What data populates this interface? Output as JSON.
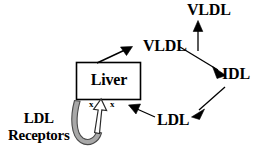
{
  "diagram": {
    "background_color": "#ffffff",
    "stroke_color": "#000000",
    "receptor_fill_color": "#a8a8a8",
    "arrow_hollow_fill_color": "#ffffff",
    "nodes": [
      {
        "id": "vldl-plasma",
        "label": "VLDL"
      },
      {
        "id": "vldl-hepatic",
        "label": "VLDL"
      },
      {
        "id": "idl",
        "label": "IDL"
      },
      {
        "id": "ldl",
        "label": "LDL"
      },
      {
        "id": "liver",
        "label": "Liver"
      }
    ],
    "receptors": {
      "label_line_1": "LDL",
      "label_line_2": "Receptors"
    },
    "markers": {
      "left": "x",
      "right": "x"
    },
    "edges": [
      {
        "id": "liver-to-vldl",
        "from": "liver",
        "to": "vldl-hepatic",
        "style": "solid-filled-arrow"
      },
      {
        "id": "vldl-to-plasma",
        "from": "vldl-hepatic",
        "to": "vldl-plasma",
        "style": "solid-filled-arrow"
      },
      {
        "id": "vldl-to-idl",
        "from": "vldl-hepatic",
        "to": "idl",
        "style": "solid-filled-arrow"
      },
      {
        "id": "idl-to-ldl",
        "from": "idl",
        "to": "ldl",
        "style": "solid-filled-arrow"
      },
      {
        "id": "ldl-to-liver",
        "from": "ldl",
        "to": "liver",
        "style": "solid-filled-arrow"
      },
      {
        "id": "receptors-to-liver",
        "from": "ldl-receptors",
        "to": "liver",
        "style": "hollow-u-arrow"
      }
    ]
  }
}
